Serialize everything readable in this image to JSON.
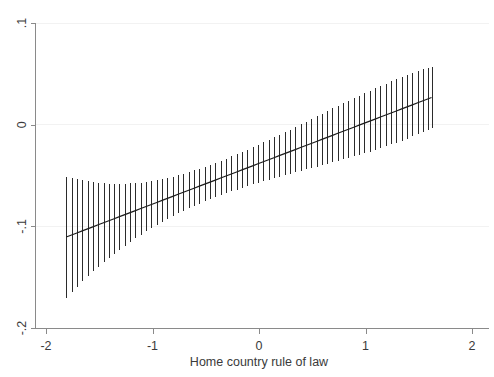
{
  "chart_data": {
    "type": "line",
    "title": "",
    "subtitle": "",
    "xlabel": "Home country rule of law",
    "ylabel": "",
    "xlim": [
      -2,
      2
    ],
    "ylim": [
      -0.2,
      0.1
    ],
    "xticks": [
      -2,
      -1,
      0,
      1,
      2
    ],
    "xticklabels": [
      "-2",
      "-1",
      "0",
      "1",
      "2"
    ],
    "yticks": [
      0.1,
      0,
      -0.1,
      -0.2
    ],
    "yticklabels": [
      ".1",
      "0",
      "-.1",
      "-.2"
    ],
    "grid": "horizontal-faint",
    "legend": "none",
    "x_data_range": [
      -1.81,
      1.62
    ],
    "series": [
      {
        "name": "Marginal effect",
        "style": "line-with-ci-bars",
        "x": [
          -1.81,
          -1.76,
          -1.71,
          -1.66,
          -1.61,
          -1.56,
          -1.51,
          -1.46,
          -1.41,
          -1.36,
          -1.31,
          -1.26,
          -1.21,
          -1.16,
          -1.11,
          -1.06,
          -1.01,
          -0.96,
          -0.91,
          -0.86,
          -0.81,
          -0.76,
          -0.71,
          -0.66,
          -0.61,
          -0.56,
          -0.51,
          -0.46,
          -0.41,
          -0.36,
          -0.31,
          -0.26,
          -0.21,
          -0.16,
          -0.11,
          -0.06,
          -0.01,
          0.04,
          0.09,
          0.14,
          0.19,
          0.24,
          0.29,
          0.34,
          0.39,
          0.44,
          0.49,
          0.54,
          0.59,
          0.64,
          0.69,
          0.74,
          0.79,
          0.84,
          0.89,
          0.94,
          0.99,
          1.04,
          1.09,
          1.14,
          1.19,
          1.24,
          1.29,
          1.34,
          1.39,
          1.44,
          1.49,
          1.54,
          1.59,
          1.62
        ],
        "y": [
          -0.1105,
          -0.1085,
          -0.1065,
          -0.1045,
          -0.1025,
          -0.1005,
          -0.0985,
          -0.0965,
          -0.0945,
          -0.0925,
          -0.0905,
          -0.0885,
          -0.0865,
          -0.0845,
          -0.0825,
          -0.0805,
          -0.0785,
          -0.0765,
          -0.0745,
          -0.0725,
          -0.0705,
          -0.0685,
          -0.0665,
          -0.0645,
          -0.0625,
          -0.0605,
          -0.0585,
          -0.0565,
          -0.0545,
          -0.0525,
          -0.0505,
          -0.0485,
          -0.0465,
          -0.0445,
          -0.0425,
          -0.0405,
          -0.0385,
          -0.0365,
          -0.0345,
          -0.0325,
          -0.0305,
          -0.0285,
          -0.0265,
          -0.0245,
          -0.0225,
          -0.0205,
          -0.0185,
          -0.0165,
          -0.0145,
          -0.0125,
          -0.0105,
          -0.0085,
          -0.0065,
          -0.0045,
          -0.0025,
          -0.0005,
          0.0015,
          0.0035,
          0.0055,
          0.0075,
          0.0095,
          0.0115,
          0.0135,
          0.0155,
          0.0175,
          0.0195,
          0.0215,
          0.0235,
          0.0255,
          0.0267
        ],
        "ci_lower": [
          -0.17,
          -0.1645,
          -0.1592,
          -0.1541,
          -0.1492,
          -0.1444,
          -0.1398,
          -0.1353,
          -0.131,
          -0.1268,
          -0.1228,
          -0.1189,
          -0.1152,
          -0.1116,
          -0.1081,
          -0.1048,
          -0.1016,
          -0.0985,
          -0.0955,
          -0.0927,
          -0.0899,
          -0.0873,
          -0.0848,
          -0.0823,
          -0.08,
          -0.0777,
          -0.0755,
          -0.0734,
          -0.0714,
          -0.0694,
          -0.0675,
          -0.0657,
          -0.0639,
          -0.0622,
          -0.0605,
          -0.0588,
          -0.0572,
          -0.0557,
          -0.0541,
          -0.0526,
          -0.0511,
          -0.0497,
          -0.0482,
          -0.0468,
          -0.0454,
          -0.044,
          -0.0426,
          -0.0412,
          -0.0398,
          -0.0384,
          -0.037,
          -0.0355,
          -0.0341,
          -0.0326,
          -0.0311,
          -0.0296,
          -0.028,
          -0.0264,
          -0.0247,
          -0.023,
          -0.0213,
          -0.0195,
          -0.0176,
          -0.0157,
          -0.0137,
          -0.0116,
          -0.0095,
          -0.0073,
          -0.005,
          -0.0033
        ],
        "ci_upper": [
          -0.051,
          -0.0525,
          -0.0538,
          -0.0549,
          -0.0558,
          -0.0566,
          -0.0572,
          -0.0577,
          -0.058,
          -0.0582,
          -0.0582,
          -0.0581,
          -0.0578,
          -0.0574,
          -0.0569,
          -0.0562,
          -0.0554,
          -0.0545,
          -0.0535,
          -0.0523,
          -0.0511,
          -0.0497,
          -0.0482,
          -0.0467,
          -0.045,
          -0.0433,
          -0.0415,
          -0.0396,
          -0.0376,
          -0.0356,
          -0.0335,
          -0.0313,
          -0.0291,
          -0.0268,
          -0.0245,
          -0.0222,
          -0.0198,
          -0.0173,
          -0.0149,
          -0.0124,
          -0.0099,
          -0.0073,
          -0.0048,
          -0.0022,
          0.0004,
          0.003,
          0.0056,
          0.0082,
          0.0108,
          0.0134,
          0.016,
          0.0185,
          0.0211,
          0.0236,
          0.0261,
          0.0286,
          0.031,
          0.0334,
          0.0357,
          0.038,
          0.0403,
          0.0425,
          0.0446,
          0.0467,
          0.0487,
          0.0506,
          0.0525,
          0.0543,
          0.056,
          0.0567
        ]
      }
    ],
    "colors": {
      "line": "#1c1c1c",
      "ci_bar": "#2b2b2b",
      "axis": "#8a8a8a",
      "grid": "#f2f2f2",
      "text": "#3a3a3a",
      "background": "#ffffff"
    }
  }
}
